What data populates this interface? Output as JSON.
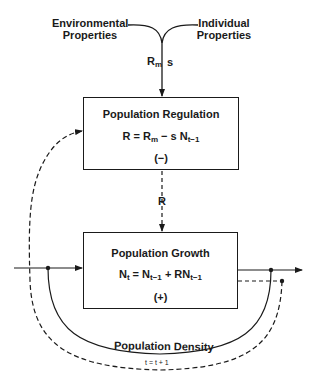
{
  "inputs": {
    "environmental_line1": "Environmental",
    "environmental_line2": "Properties",
    "individual_line1": "Individual",
    "individual_line2": "Properties",
    "rm_label": "R",
    "rm_sub": "m",
    "s_label": "s"
  },
  "regulation_box": {
    "title": "Population Regulation",
    "eq_lhs": "R = R",
    "eq_sub1": "m",
    "eq_mid": " − s N",
    "eq_sub2": "t−1",
    "sign": "(−)"
  },
  "connector": {
    "r_label": "R"
  },
  "growth_box": {
    "title": "Population Growth",
    "eq_a": "N",
    "eq_sub_a": "t",
    "eq_b": " = N",
    "eq_sub_b": "t−1",
    "eq_c": " + RN",
    "eq_sub_c": "t−1",
    "sign": "(+)"
  },
  "feedback": {
    "density_label": "Population Density",
    "time_step": "t = t + 1"
  }
}
